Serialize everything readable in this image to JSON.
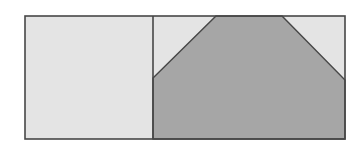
{
  "diagram": {
    "canvas": {
      "width": 360,
      "height": 144,
      "background": "#ffffff"
    },
    "colors": {
      "light_fill": "#e4e4e4",
      "dark_fill": "#a6a6a6",
      "stroke": "#474747"
    },
    "outer_rect": {
      "x": 25,
      "y": 16,
      "width": 320,
      "height": 123
    },
    "left_panel": {
      "x": 25,
      "y": 16,
      "width": 128,
      "height": 123,
      "fill": "light"
    },
    "right_panel": {
      "x": 153,
      "y": 16,
      "width": 192,
      "height": 123,
      "fill": "light"
    },
    "trapezoid": {
      "points": "153,78 216,16 282,16 345,80 345,139 153,139",
      "fill": "dark"
    },
    "divider": {
      "x": 153,
      "y1": 16,
      "y2": 139
    }
  }
}
